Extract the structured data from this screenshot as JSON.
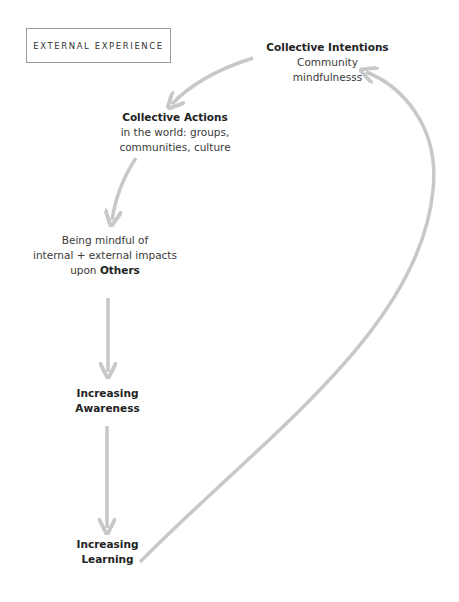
{
  "section_label": "EXTERNAL EXPERIENCE",
  "nodes": {
    "collective_intentions": {
      "title": "Collective Intentions",
      "line1": "Community",
      "line2": "mindfulnesss"
    },
    "collective_actions": {
      "title": "Collective Actions",
      "line1": "in the world: groups,",
      "line2": "communities, culture"
    },
    "mindful_others": {
      "line1": "Being mindful of",
      "line2": "internal + external impacts",
      "line3_prefix": "upon ",
      "line3_bold": "Others"
    },
    "increasing_awareness": {
      "line1": "Increasing",
      "line2": "Awareness"
    },
    "increasing_learning": {
      "line1": "Increasing",
      "line2": "Learning"
    }
  },
  "colors": {
    "arrow": "#c8c8c8",
    "text": "#2b2b2b",
    "box_border": "#9a9a9a"
  }
}
